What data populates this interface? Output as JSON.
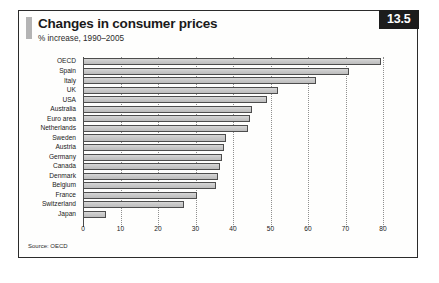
{
  "figure": {
    "number_badge": "13.5",
    "title": "Changes in consumer prices",
    "subtitle": "% increase, 1990–2005",
    "source": "Source: OECD",
    "colors": {
      "badge_background": "#1c1c1c",
      "badge_text": "#ffffff",
      "bar_fill": "#cccccc",
      "bar_border": "#4d4d4d",
      "frame_border": "#2b2b2b",
      "background": "#fefefd",
      "accent_bar": "#b4b4b4",
      "gridline": "#8f8f8f"
    }
  },
  "chart_data": {
    "type": "bar",
    "orientation": "horizontal",
    "title": "Changes in consumer prices",
    "subtitle": "% increase, 1990–2005",
    "xlabel": "",
    "ylabel": "",
    "xlim": [
      0,
      80
    ],
    "xticks": [
      0,
      10,
      20,
      30,
      40,
      50,
      60,
      70,
      80
    ],
    "xtick_labels": [
      "0",
      "10",
      "20",
      "30",
      "40",
      "50",
      "60",
      "70",
      "80"
    ],
    "grid": "vertical-dotted",
    "legend": "none",
    "source": "Source: OECD",
    "categories": [
      "OECD",
      "Spain",
      "Italy",
      "UK",
      "USA",
      "Australia",
      "Euro area",
      "Netherlands",
      "Sweden",
      "Austria",
      "Germany",
      "Canada",
      "Denmark",
      "Belgium",
      "France",
      "Switzerland",
      "Japan"
    ],
    "values": [
      79.5,
      71.0,
      62.0,
      52.0,
      49.0,
      45.0,
      44.5,
      44.0,
      38.0,
      37.5,
      37.0,
      36.5,
      36.0,
      35.5,
      30.5,
      27.0,
      6.0
    ]
  }
}
